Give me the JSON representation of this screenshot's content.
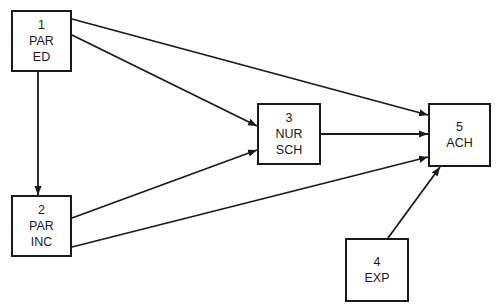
{
  "diagram": {
    "type": "path-diagram",
    "nodes": [
      {
        "id": "1",
        "number": "1",
        "lines": [
          "PAR",
          "ED"
        ],
        "x": 11,
        "y": 10,
        "w": 61,
        "h": 62
      },
      {
        "id": "2",
        "number": "2",
        "lines": [
          "PAR",
          "INC"
        ],
        "x": 11,
        "y": 195,
        "w": 61,
        "h": 62
      },
      {
        "id": "3",
        "number": "3",
        "lines": [
          "NUR",
          "SCH"
        ],
        "x": 257,
        "y": 103,
        "w": 64,
        "h": 62
      },
      {
        "id": "4",
        "number": "4",
        "lines": [
          "EXP"
        ],
        "x": 345,
        "y": 238,
        "w": 64,
        "h": 64
      },
      {
        "id": "5",
        "number": "5",
        "lines": [
          "ACH"
        ],
        "x": 428,
        "y": 103,
        "w": 63,
        "h": 64
      }
    ],
    "edges": [
      {
        "from": "1",
        "to": "5",
        "x1": 72,
        "y1": 19,
        "x2": 428,
        "y2": 115
      },
      {
        "from": "1",
        "to": "3",
        "x1": 72,
        "y1": 35,
        "x2": 257,
        "y2": 126
      },
      {
        "from": "1",
        "to": "2",
        "x1": 38,
        "y1": 72,
        "x2": 38,
        "y2": 195
      },
      {
        "from": "2",
        "to": "3",
        "x1": 72,
        "y1": 218,
        "x2": 257,
        "y2": 150
      },
      {
        "from": "2",
        "to": "5",
        "x1": 72,
        "y1": 247,
        "x2": 428,
        "y2": 157
      },
      {
        "from": "3",
        "to": "5",
        "x1": 321,
        "y1": 134,
        "x2": 428,
        "y2": 134
      },
      {
        "from": "4",
        "to": "5",
        "x1": 388,
        "y1": 238,
        "x2": 440,
        "y2": 167
      }
    ],
    "colors": {
      "stroke": "#1a1a1a",
      "background": "#ffffff"
    }
  }
}
